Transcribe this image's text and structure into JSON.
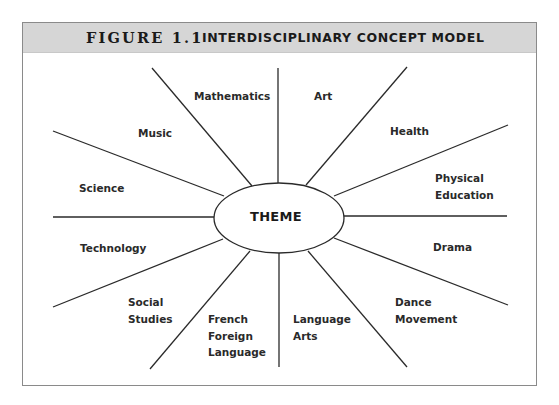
{
  "figure": {
    "number": "FIGURE 1.1",
    "title": "INTERDISCIPLINARY CONCEPT MODEL"
  },
  "center": {
    "label": "THEME"
  },
  "spokes": [
    {
      "name": "mathematics",
      "lines": [
        "Mathematics"
      ]
    },
    {
      "name": "art",
      "lines": [
        "Art"
      ]
    },
    {
      "name": "health",
      "lines": [
        "Health"
      ]
    },
    {
      "name": "physical-education",
      "lines": [
        "Physical",
        "Education"
      ]
    },
    {
      "name": "drama",
      "lines": [
        "Drama"
      ]
    },
    {
      "name": "dance-movement",
      "lines": [
        "Dance",
        "Movement"
      ]
    },
    {
      "name": "language-arts",
      "lines": [
        "Language",
        "Arts"
      ]
    },
    {
      "name": "french-foreign-language",
      "lines": [
        "French",
        "Foreign",
        "Language"
      ]
    },
    {
      "name": "social-studies",
      "lines": [
        "Social",
        "Studies"
      ]
    },
    {
      "name": "technology",
      "lines": [
        "Technology"
      ]
    },
    {
      "name": "science",
      "lines": [
        "Science"
      ]
    },
    {
      "name": "music",
      "lines": [
        "Music"
      ]
    }
  ],
  "colors": {
    "header_bg": "#d6d6d6",
    "line": "#2a2a2a",
    "text": "#1a1a1a",
    "border": "#8a8a8a"
  }
}
